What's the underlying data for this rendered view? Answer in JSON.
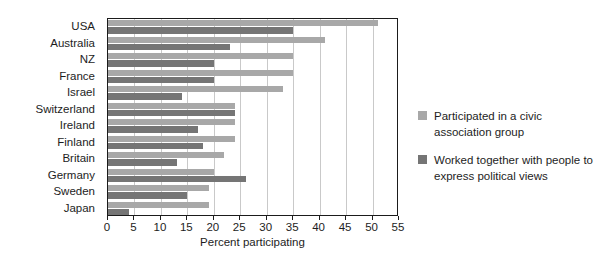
{
  "chart_data": {
    "type": "bar",
    "orientation": "horizontal",
    "title": "",
    "xlabel": "Percent participating",
    "ylabel": "",
    "xlim": [
      0,
      55
    ],
    "xticks": [
      0,
      5,
      10,
      15,
      20,
      25,
      30,
      35,
      40,
      45,
      50,
      55
    ],
    "grid": "vertical",
    "legend_position": "right",
    "categories": [
      "USA",
      "Australia",
      "NZ",
      "France",
      "Israel",
      "Switzerland",
      "Ireland",
      "Finland",
      "Britain",
      "Germany",
      "Sweden",
      "Japan"
    ],
    "series": [
      {
        "name": "Participated in a civic association group",
        "color": "#a8a8a8",
        "values": [
          51,
          41,
          35,
          35,
          33,
          24,
          24,
          24,
          22,
          20,
          19,
          19
        ]
      },
      {
        "name": "Worked together with people to express political views",
        "color": "#757575",
        "values": [
          35,
          23,
          20,
          20,
          14,
          24,
          17,
          18,
          13,
          26,
          15,
          4
        ]
      }
    ]
  },
  "axis": {
    "x_title": "Percent participating",
    "tick_labels": [
      "0",
      "5",
      "10",
      "15",
      "20",
      "25",
      "30",
      "35",
      "40",
      "45",
      "50",
      "55"
    ]
  },
  "legend": {
    "items": [
      {
        "label": "Participated in a civic association group",
        "color": "#a8a8a8"
      },
      {
        "label": "Worked together with people to express political views",
        "color": "#757575"
      }
    ]
  },
  "colors": {
    "series_light": "#a8a8a8",
    "series_dark": "#757575",
    "axis": "#1b1b1b",
    "grid": "#c9c9c9",
    "background": "#ffffff",
    "text": "#1d1d1d"
  }
}
